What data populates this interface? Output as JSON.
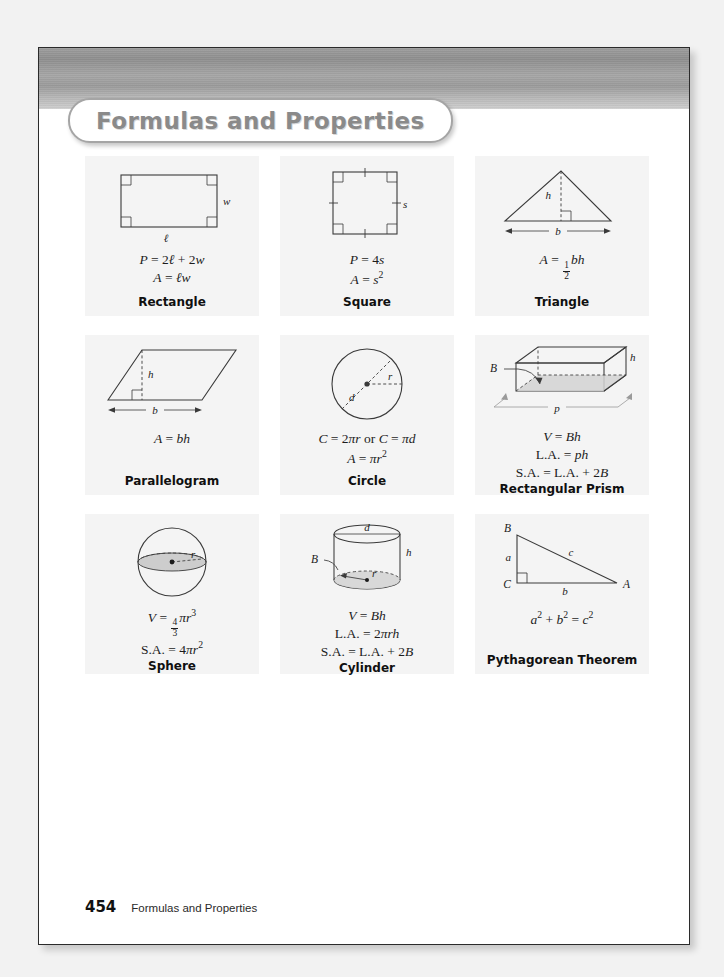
{
  "page": {
    "banner_title": "Formulas and Properties",
    "footer_page_number": "454",
    "footer_title": "Formulas and Properties"
  },
  "cards": [
    {
      "name": "rectangle",
      "label": "Rectangle",
      "diagram_labels": [
        "w",
        "ℓ"
      ],
      "formulas": [
        "P = 2ℓ + 2w",
        "A = ℓw"
      ]
    },
    {
      "name": "square",
      "label": "Square",
      "diagram_labels": [
        "s"
      ],
      "formulas": [
        "P = 4s",
        "A = s²"
      ]
    },
    {
      "name": "triangle",
      "label": "Triangle",
      "diagram_labels": [
        "h",
        "b"
      ],
      "formulas": [
        "A = ½bh"
      ]
    },
    {
      "name": "parallelogram",
      "label": "Parallelogram",
      "diagram_labels": [
        "h",
        "b"
      ],
      "formulas": [
        "A = bh"
      ]
    },
    {
      "name": "circle",
      "label": "Circle",
      "diagram_labels": [
        "d",
        "r"
      ],
      "formulas": [
        "C = 2πr or C = πd",
        "A = πr²"
      ]
    },
    {
      "name": "rectangular-prism",
      "label": "Rectangular Prism",
      "diagram_labels": [
        "B",
        "h",
        "p"
      ],
      "formulas": [
        "V = Bh",
        "L.A. = ph",
        "S.A. = L.A. + 2B"
      ]
    },
    {
      "name": "sphere",
      "label": "Sphere",
      "diagram_labels": [
        "r"
      ],
      "formulas": [
        "V = 4/3πr³",
        "S.A. = 4πr²"
      ]
    },
    {
      "name": "cylinder",
      "label": "Cylinder",
      "diagram_labels": [
        "d",
        "B",
        "h",
        "r"
      ],
      "formulas": [
        "V = Bh",
        "L.A. = 2πrh",
        "S.A. = L.A. + 2B"
      ]
    },
    {
      "name": "pythagorean-theorem",
      "label": "Pythagorean Theorem",
      "diagram_labels": [
        "A",
        "B",
        "C",
        "a",
        "b",
        "c"
      ],
      "formulas": [
        "a² + b² = c²"
      ]
    }
  ],
  "colors": {
    "page_background": "#f2f2f2",
    "sheet": "#ffffff",
    "banner_gray": "#9d9d9d",
    "card_background": "#f4f4f4",
    "title_gray": "#8a8a8a",
    "line": "#3a3a3a",
    "shade": "#c9c9c9"
  }
}
